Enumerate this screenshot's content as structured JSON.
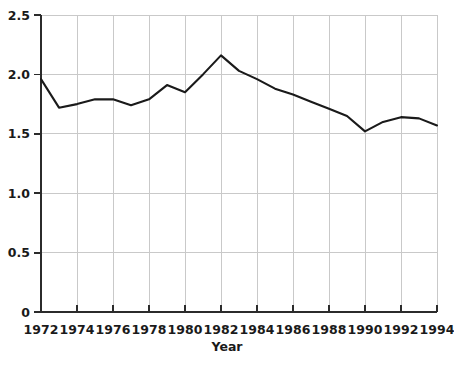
{
  "chart_data": {
    "type": "line",
    "title": "",
    "xlabel": "Year",
    "ylabel": "",
    "xlim": [
      1972,
      1994
    ],
    "ylim": [
      0,
      2.5
    ],
    "grid": true,
    "legend": false,
    "x": [
      1972,
      1973,
      1974,
      1975,
      1976,
      1977,
      1978,
      1979,
      1980,
      1981,
      1982,
      1983,
      1984,
      1985,
      1986,
      1987,
      1988,
      1989,
      1990,
      1991,
      1992,
      1993,
      1994
    ],
    "series": [
      {
        "name": "series-1",
        "color": "#1a1a1a",
        "values": [
          1.96,
          1.72,
          1.75,
          1.79,
          1.79,
          1.74,
          1.79,
          1.91,
          1.85,
          2.0,
          2.16,
          2.03,
          1.96,
          1.88,
          1.83,
          1.77,
          1.71,
          1.65,
          1.52,
          1.6,
          1.64,
          1.63,
          1.57
        ]
      }
    ],
    "x_tick_values": [
      1972,
      1974,
      1976,
      1978,
      1980,
      1982,
      1984,
      1986,
      1988,
      1990,
      1992,
      1994
    ],
    "x_tick_labels": [
      "1972",
      "1974",
      "1976",
      "1978",
      "1980",
      "1982",
      "1984",
      "1986",
      "1988",
      "1990",
      "1992",
      "1994"
    ],
    "y_tick_values": [
      0,
      0.5,
      1.0,
      1.5,
      2.0,
      2.5
    ],
    "y_tick_labels": [
      "0",
      "0.5",
      "1.0",
      "1.5",
      "2.0",
      "2.5"
    ],
    "colors": {
      "line": "#1a1a1a",
      "grid": "#c9c9c9",
      "axis": "#2b2b2b",
      "text": "#1a1a1a",
      "background": "#ffffff"
    }
  }
}
